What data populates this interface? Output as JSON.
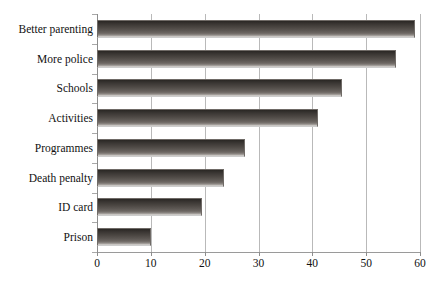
{
  "chart_data": {
    "type": "bar",
    "orientation": "horizontal",
    "title": "",
    "subtitle": "",
    "xlabel": "",
    "ylabel": "",
    "categories": [
      "Better parenting",
      "More police",
      "Schools",
      "Activities",
      "Programmes",
      "Death penalty",
      "ID card",
      "Prison"
    ],
    "values": [
      59,
      55.5,
      45.5,
      41,
      27.5,
      23.5,
      19.5,
      10
    ],
    "xlim": [
      0,
      60
    ],
    "xticks": [
      0,
      10,
      20,
      30,
      40,
      50,
      60
    ],
    "xtick_labels": [
      "0",
      "10",
      "20",
      "30",
      "40",
      "50",
      "60"
    ],
    "grid": "vertical",
    "legend": "none",
    "bar_color": "#4d4844",
    "bar_edge_color": "#6f6a66",
    "gridline_color": "#b9b9b9",
    "background_color": "#ffffff",
    "annotations": []
  }
}
